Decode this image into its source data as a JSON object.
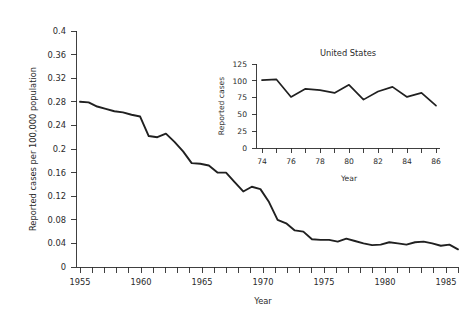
{
  "chart_data": [
    {
      "id": "main",
      "type": "line",
      "title": "",
      "xlabel": "Year",
      "ylabel": "Reported cases per 100,000 population",
      "xlim": [
        1955,
        1986
      ],
      "ylim": [
        0,
        0.4
      ],
      "grid": false,
      "legend": "none",
      "xticks": [
        1955,
        1956,
        1957,
        1958,
        1959,
        1960,
        1961,
        1962,
        1963,
        1964,
        1965,
        1966,
        1967,
        1968,
        1969,
        1970,
        1971,
        1972,
        1973,
        1974,
        1975,
        1976,
        1977,
        1978,
        1979,
        1980,
        1981,
        1982,
        1983,
        1984,
        1985,
        1986
      ],
      "xtick_labels": [
        "1955",
        "",
        "",
        "",
        "",
        "1960",
        "",
        "",
        "",
        "",
        "1965",
        "",
        "",
        "",
        "",
        "1970",
        "",
        "",
        "",
        "",
        "1975",
        "",
        "",
        "",
        "",
        "1980",
        "",
        "",
        "",
        "",
        "1985",
        ""
      ],
      "yticks": [
        0,
        0.04,
        0.08,
        0.12,
        0.16,
        0.2,
        0.24,
        0.28,
        0.32,
        0.36,
        0.4
      ],
      "ytick_labels": [
        "0",
        "0.04",
        "0.08",
        "0.12",
        "0.16",
        "0.2",
        "0.24",
        "0.28",
        "0.32",
        "0.36",
        "0.4"
      ],
      "x": [
        1955,
        1956,
        1957,
        1958,
        1959,
        1960,
        1961,
        1962,
        1963,
        1964,
        1965,
        1966,
        1967,
        1968,
        1969,
        1970,
        1971,
        1972,
        1973,
        1974,
        1975,
        1976,
        1977,
        1978,
        1979,
        1980,
        1981,
        1982,
        1983,
        1984,
        1985,
        1986
      ],
      "values": [
        0.28,
        0.279,
        0.272,
        0.268,
        0.264,
        0.262,
        0.258,
        0.255,
        0.222,
        0.22,
        0.226,
        0.212,
        0.196,
        0.176,
        0.175,
        0.172,
        0.16,
        0.16,
        0.144,
        0.128,
        0.136,
        0.132,
        0.11,
        0.08,
        0.074,
        0.062,
        0.06,
        0.047,
        0.046,
        0.046,
        0.043,
        0.048,
        0.044,
        0.04,
        0.037,
        0.038,
        0.042,
        0.04,
        0.038,
        0.042,
        0.043,
        0.04,
        0.036,
        0.038,
        0.03
      ],
      "series_note": "Single series, declining trend from 0.28 in 1955 to about 0.03 in 1986"
    },
    {
      "id": "inset",
      "type": "line",
      "title": "United States",
      "xlabel": "Year",
      "ylabel": "Reported cases",
      "xlim": [
        74,
        86
      ],
      "ylim": [
        0,
        125
      ],
      "grid": false,
      "legend": "none",
      "xticks": [
        74,
        75,
        76,
        77,
        78,
        79,
        80,
        81,
        82,
        83,
        84,
        85,
        86
      ],
      "xtick_labels": [
        "74",
        "",
        "76",
        "",
        "78",
        "",
        "80",
        "",
        "82",
        "",
        "84",
        "",
        "86"
      ],
      "yticks": [
        0,
        25,
        50,
        75,
        100,
        125
      ],
      "ytick_labels": [
        "0",
        "25",
        "50",
        "75",
        "100",
        "125"
      ],
      "x": [
        74,
        75,
        76,
        77,
        78,
        79,
        80,
        81,
        82,
        83,
        84,
        85,
        86
      ],
      "values": [
        101,
        102,
        76,
        88,
        86,
        82,
        94,
        72,
        84,
        91,
        76,
        82,
        63
      ]
    }
  ],
  "main_chart": {
    "ylabel": "Reported cases per 100,000 population",
    "xlabel": "Year",
    "ytick_labels": [
      "0.4",
      "0.36",
      "0.32",
      "0.28",
      "0.24",
      "0.2",
      "0.16",
      "0.12",
      "0.08",
      "0.04",
      "0"
    ],
    "xtick_labels": [
      "1955",
      "1960",
      "1965",
      "1970",
      "1975",
      "1980",
      "1985"
    ]
  },
  "inset_chart": {
    "title": "United States",
    "ylabel": "Reported cases",
    "xlabel": "Year",
    "ytick_labels": [
      "125",
      "100",
      "75",
      "50",
      "25",
      "0"
    ],
    "xtick_labels": [
      "74",
      "76",
      "78",
      "80",
      "82",
      "84",
      "86"
    ]
  },
  "colors": {
    "line": "#202020",
    "axis": "#2b2b2b",
    "text": "#2b2b2b",
    "background": "#ffffff"
  }
}
